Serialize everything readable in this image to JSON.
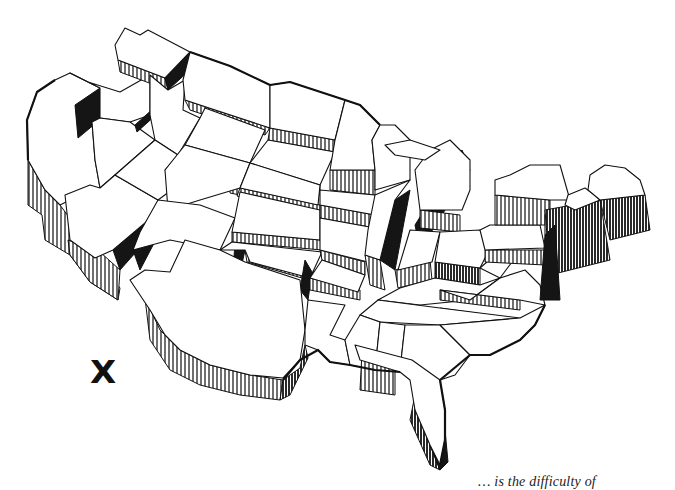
{
  "figure": {
    "type": "3D prism map (block diagram) of the contiguous United States",
    "style": "black-and-white line illustration with hatched vertical side walls",
    "colors": {
      "ink": "#111111",
      "paper": "#ffffff",
      "hatch": "#222222"
    }
  },
  "marker": {
    "label": "X",
    "symbol": "x-mark"
  },
  "caption": {
    "text_fragment": "… is the difficulty of",
    "truncated": true
  },
  "regions": [
    {
      "name": "Washington"
    },
    {
      "name": "Oregon"
    },
    {
      "name": "California"
    },
    {
      "name": "Idaho"
    },
    {
      "name": "Nevada"
    },
    {
      "name": "Montana"
    },
    {
      "name": "Wyoming"
    },
    {
      "name": "Utah"
    },
    {
      "name": "Arizona"
    },
    {
      "name": "Colorado"
    },
    {
      "name": "New Mexico"
    },
    {
      "name": "North Dakota"
    },
    {
      "name": "South Dakota"
    },
    {
      "name": "Nebraska"
    },
    {
      "name": "Kansas"
    },
    {
      "name": "Oklahoma"
    },
    {
      "name": "Texas"
    },
    {
      "name": "Minnesota"
    },
    {
      "name": "Iowa"
    },
    {
      "name": "Missouri"
    },
    {
      "name": "Arkansas"
    },
    {
      "name": "Louisiana"
    },
    {
      "name": "Wisconsin"
    },
    {
      "name": "Illinois"
    },
    {
      "name": "Michigan"
    },
    {
      "name": "Indiana"
    },
    {
      "name": "Ohio"
    },
    {
      "name": "Kentucky"
    },
    {
      "name": "Tennessee"
    },
    {
      "name": "Mississippi"
    },
    {
      "name": "Alabama"
    },
    {
      "name": "Georgia"
    },
    {
      "name": "Florida"
    },
    {
      "name": "South Carolina"
    },
    {
      "name": "North Carolina"
    },
    {
      "name": "Virginia"
    },
    {
      "name": "West Virginia"
    },
    {
      "name": "Pennsylvania"
    },
    {
      "name": "New York"
    },
    {
      "name": "New England"
    },
    {
      "name": "Maine"
    }
  ]
}
